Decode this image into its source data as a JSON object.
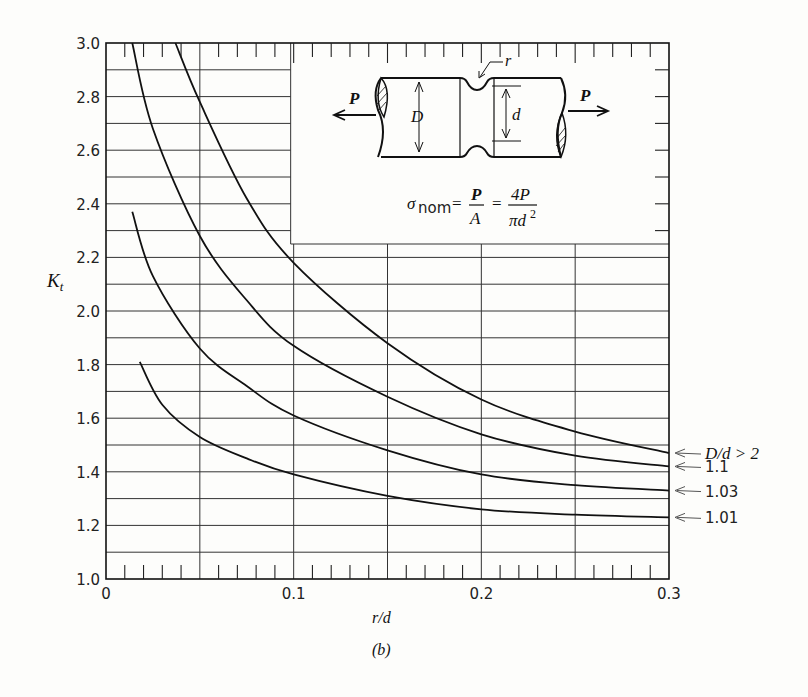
{
  "chart_data": {
    "type": "line",
    "title": "",
    "xlabel": "r/d",
    "ylabel": "K_t",
    "caption": "(b)",
    "xlim": [
      0,
      0.3
    ],
    "ylim": [
      1.0,
      3.0
    ],
    "x_ticks": [
      "0",
      "0.1",
      "0.2",
      "0.3"
    ],
    "y_ticks": [
      "1.0",
      "1.2",
      "1.4",
      "1.6",
      "1.8",
      "2.0",
      "2.2",
      "2.4",
      "2.6",
      "2.8",
      "3.0"
    ],
    "grid": true,
    "grid_minor_y": 0.1,
    "grid_major_x": 0.05,
    "minor_x_ticks": 0.01,
    "legend_position": "right, arrow-labelled at curve ends",
    "series": [
      {
        "name": "D/d > 2",
        "label": "D/d > 2",
        "x": [
          0.037,
          0.05,
          0.075,
          0.1,
          0.15,
          0.2,
          0.25,
          0.3
        ],
        "y": [
          3.0,
          2.78,
          2.42,
          2.18,
          1.88,
          1.67,
          1.55,
          1.47
        ]
      },
      {
        "name": "1.1",
        "label": "1.1",
        "x": [
          0.014,
          0.025,
          0.05,
          0.075,
          0.1,
          0.15,
          0.2,
          0.25,
          0.3
        ],
        "y": [
          3.0,
          2.68,
          2.28,
          2.04,
          1.87,
          1.68,
          1.54,
          1.46,
          1.42
        ]
      },
      {
        "name": "1.03",
        "label": "1.03",
        "x": [
          0.014,
          0.025,
          0.05,
          0.075,
          0.1,
          0.15,
          0.2,
          0.25,
          0.3
        ],
        "y": [
          2.37,
          2.13,
          1.86,
          1.72,
          1.61,
          1.48,
          1.39,
          1.35,
          1.33
        ]
      },
      {
        "name": "1.01",
        "label": "1.01",
        "x": [
          0.018,
          0.03,
          0.05,
          0.075,
          0.1,
          0.15,
          0.2,
          0.25,
          0.3
        ],
        "y": [
          1.81,
          1.65,
          1.53,
          1.45,
          1.39,
          1.31,
          1.26,
          1.24,
          1.23
        ]
      }
    ],
    "inset": {
      "formula_lhs": "σ",
      "formula_sub": "nom",
      "formula_eq1": "=",
      "formula_num1": "P",
      "formula_den1": "A",
      "formula_eq2": "=",
      "formula_num2": "4P",
      "formula_den2": "πd",
      "formula_den2_sup": "2",
      "labels": {
        "load_left": "P",
        "load_right": "P",
        "diameter_large": "D",
        "diameter_small": "d",
        "radius": "r"
      }
    }
  }
}
